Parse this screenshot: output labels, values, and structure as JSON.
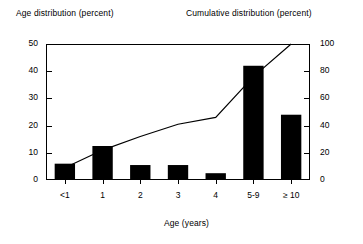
{
  "chart_data": {
    "type": "bar",
    "title": "",
    "xlabel": "Age (years)",
    "ylabel": "Age distribution (percent)",
    "y2label": "Cumulative distribution (percent)",
    "categories": [
      "<1",
      "1",
      "2",
      "3",
      "4",
      "5-9",
      "≥ 10"
    ],
    "grid": false,
    "legend": "none",
    "ylim": [
      0,
      50
    ],
    "yticks": [
      0,
      10,
      20,
      30,
      40,
      50
    ],
    "y2lim": [
      0,
      100
    ],
    "y2ticks": [
      0,
      20,
      40,
      60,
      80,
      100
    ],
    "series": [
      {
        "name": "Age distribution (percent)",
        "type": "bar",
        "axis": "left",
        "color": "#000000",
        "values": [
          6,
          12.5,
          5.5,
          5.5,
          2.5,
          42,
          24
        ]
      },
      {
        "name": "Cumulative distribution (percent)",
        "type": "line",
        "axis": "right",
        "color": "#000000",
        "values": [
          9,
          22,
          32,
          41,
          46,
          76,
          100
        ]
      }
    ]
  },
  "labels": {
    "left_axis_title": "Age distribution (percent)",
    "right_axis_title": "Cumulative distribution (percent)",
    "x_axis_title": "Age (years)"
  },
  "ticks": {
    "left": [
      "50",
      "40",
      "30",
      "20",
      "10",
      "0"
    ],
    "right": [
      "100",
      "80",
      "60",
      "40",
      "20",
      "0"
    ],
    "x": [
      "<1",
      "1",
      "2",
      "3",
      "4",
      "5-9",
      "≥ 10"
    ]
  }
}
